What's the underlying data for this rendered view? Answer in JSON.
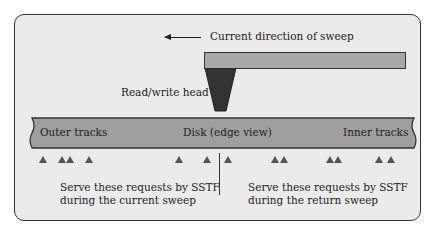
{
  "diagram": {
    "direction_label": "Current direction of sweep",
    "head_label": "Read/write head",
    "disk": {
      "outer_label": "Outer tracks",
      "center_label": "Disk (edge view)",
      "inner_label": "Inner tracks"
    },
    "left_caption": [
      "Serve these requests by SSTF",
      "during the current sweep"
    ],
    "right_caption": [
      "Serve these requests by SSTF",
      "during the return sweep"
    ],
    "requests_x": [
      43,
      62,
      70,
      89,
      179,
      207,
      228,
      275,
      284,
      330,
      338,
      379,
      391
    ],
    "divider_x": 219,
    "colors": {
      "panel": "#ebebeb",
      "disk": "#9f9f9f",
      "arm": "#a8a8a8",
      "head": "#333333",
      "request": "#555555"
    }
  }
}
